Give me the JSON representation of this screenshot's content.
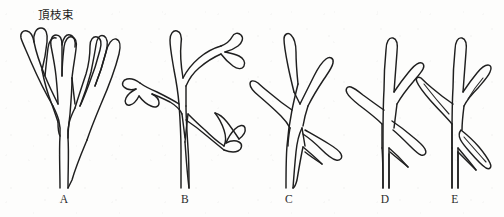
{
  "diagram": {
    "title_text": "頂枝束",
    "annotation_name": "apical-branch-bundle-label",
    "line_color": "#1f1f1f",
    "background_color": "#fdfdfc",
    "panel_count": 5,
    "panels": [
      {
        "letter": "A",
        "name": "dichotomous-branching-stage",
        "description": "equal dichotomous branching with eight terminal telomes",
        "terminal_tips": 8,
        "center_x": 64
      },
      {
        "letter": "B",
        "name": "overtopping-stage",
        "description": "unequal branching, overtopping with forked lateral tips",
        "terminal_tips": 7,
        "center_x": 185
      },
      {
        "letter": "C",
        "name": "reduction-stage",
        "description": "reduction of lateral branch systems, simple unforked tips",
        "terminal_tips": 5,
        "center_x": 289
      },
      {
        "letter": "D",
        "name": "planation-stage",
        "description": "planation, lateral branches arranged in one plane on a dominant axis",
        "terminal_tips": 4,
        "center_x": 385
      },
      {
        "letter": "E",
        "name": "webbing-stage",
        "description": "webbing, laminar leaf blades with internal venation",
        "terminal_tips": 4,
        "center_x": 455
      }
    ]
  }
}
